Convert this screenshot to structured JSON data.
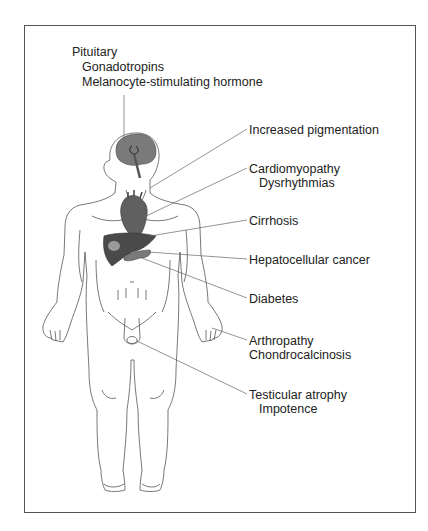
{
  "figure": {
    "type": "anatomical diagram",
    "labels": {
      "pituitary": {
        "title": "Pituitary",
        "sub1": "Gonadotropins",
        "sub2": "Melanocyte-stimulating hormone"
      },
      "skin": {
        "title": "Increased pigmentation"
      },
      "heart": {
        "title": "Cardiomyopathy",
        "sub1": "Dysrhythmias"
      },
      "liver_cirrhosis": {
        "title": "Cirrhosis"
      },
      "liver_cancer": {
        "title": "Hepatocellular cancer"
      },
      "pancreas": {
        "title": "Diabetes"
      },
      "joints": {
        "title": "Arthropathy",
        "sub1": "Chondrocalcinosis"
      },
      "testes": {
        "title": "Testicular atrophy",
        "sub1": "Impotence"
      }
    },
    "colors": {
      "line": "#555555",
      "text": "#222222",
      "organ_fill": "#555555",
      "brain_fill": "#777777"
    }
  }
}
